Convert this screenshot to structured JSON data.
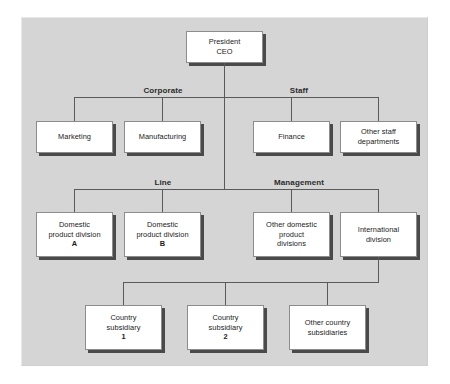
{
  "chart": {
    "panel_color": "#d5d5d5",
    "box_fill": "#ffffff",
    "box_border": "#8c8c8c",
    "shadow_color": "#4a4a4a",
    "line_color": "#5a5a5a"
  },
  "captions": {
    "corporate": "Corporate",
    "staff": "Staff",
    "line": "Line",
    "management": "Management"
  },
  "nodes": {
    "ceo": {
      "line1": "President",
      "line2": "CEO"
    },
    "marketing": {
      "line1": "Marketing"
    },
    "manufacturing": {
      "line1": "Manufacturing"
    },
    "finance": {
      "line1": "Finance"
    },
    "other_staff": {
      "line1": "Other staff",
      "line2": "departments"
    },
    "domestic_a": {
      "line1": "Domestic",
      "line2": "product division",
      "line3": "A"
    },
    "domestic_b": {
      "line1": "Domestic",
      "line2": "product division",
      "line3": "B"
    },
    "other_domestic": {
      "line1": "Other domestic",
      "line2": "product",
      "line3": "divisions"
    },
    "international": {
      "line1": "International",
      "line2": "division"
    },
    "country_1": {
      "line1": "Country",
      "line2": "subsidiary",
      "line3": "1"
    },
    "country_2": {
      "line1": "Country",
      "line2": "subsidiary",
      "line3": "2"
    },
    "other_country": {
      "line1": "Other country",
      "line2": "subsidiaries"
    }
  }
}
